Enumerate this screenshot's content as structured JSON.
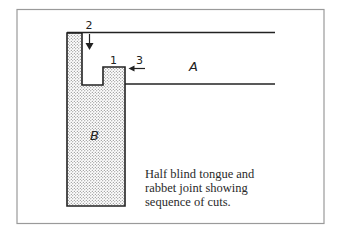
{
  "figure": {
    "labels": {
      "piece_a": "A",
      "piece_b": "B",
      "cut_1": "1",
      "cut_2": "2",
      "cut_3": "3"
    },
    "caption": {
      "lines": [
        "Half blind tongue and",
        "rabbet joint showing",
        "sequence of cuts."
      ]
    },
    "colors": {
      "frame": "#9a9a9a",
      "lines": "#222222",
      "stipple": "#555555"
    }
  }
}
